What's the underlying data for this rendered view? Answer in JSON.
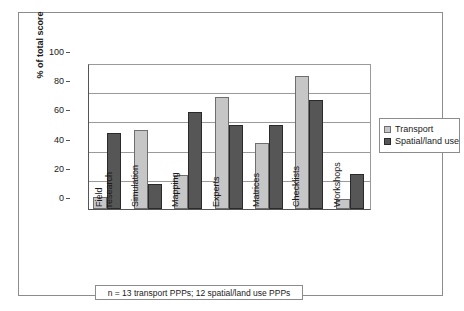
{
  "chart_data": {
    "type": "bar",
    "title": "",
    "xlabel": "",
    "ylabel": "% of total score",
    "ylim": [
      0,
      100
    ],
    "yticks": [
      0,
      20,
      40,
      60,
      80,
      100
    ],
    "grid": true,
    "legend_position": "right",
    "categories": [
      "Field\nresearch",
      "Simulation",
      "Mapping",
      "Experts",
      "Matrices",
      "Checklists",
      "Workshops"
    ],
    "series": [
      {
        "name": "Transport",
        "color": "#c6c6c6",
        "values": [
          8,
          54,
          23,
          77,
          45.5,
          91,
          7
        ]
      },
      {
        "name": "Spatial/land use",
        "color": "#565656",
        "values": [
          52,
          17,
          66.5,
          57.5,
          57.5,
          74.5,
          24
        ]
      }
    ],
    "annotation": "n = 13 transport PPPs; 12 spatial/land use PPPs"
  },
  "legend": {
    "items": [
      {
        "label": "Transport"
      },
      {
        "label": "Spatial/land use"
      }
    ]
  },
  "footnote": {
    "text": "n = 13 transport PPPs; 12 spatial/land use PPPs"
  },
  "axis": {
    "y_title": "% of total score"
  }
}
